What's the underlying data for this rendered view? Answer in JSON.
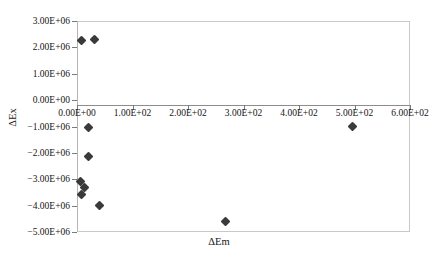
{
  "chart_data": {
    "type": "scatter",
    "title": "",
    "xlabel": "ΔEm",
    "ylabel": "ΔEx",
    "xlim": [
      0,
      600
    ],
    "ylim": [
      -5000000,
      3000000
    ],
    "grid": false,
    "legend": "none",
    "marker": "diamond",
    "marker_color": "#3a3a3a",
    "xticks": [
      0,
      100,
      200,
      300,
      400,
      500,
      600
    ],
    "xticklabels": [
      "0.00E+00",
      "1.00E+02",
      "2.00E+02",
      "3.00E+02",
      "4.00E+02",
      "5.00E+02",
      "6.00E+02"
    ],
    "yticks": [
      3000000,
      2000000,
      1000000,
      0,
      -1000000,
      -2000000,
      -3000000,
      -4000000,
      -5000000
    ],
    "yticklabels": [
      "3.00E+06",
      "2.00E+06",
      "1.00E+06",
      "0.00E+00",
      "−1.00E+06",
      "−2.00E+06",
      "−3.00E+06",
      "−4.00E+06",
      "−5.00E+06"
    ],
    "points": [
      {
        "x": 9,
        "y": 2270000
      },
      {
        "x": 32,
        "y": 2280000
      },
      {
        "x": 20,
        "y": -1020000
      },
      {
        "x": 20,
        "y": -2140000
      },
      {
        "x": 6,
        "y": -3100000
      },
      {
        "x": 14,
        "y": -3320000
      },
      {
        "x": 8,
        "y": -3590000
      },
      {
        "x": 41,
        "y": -3990000
      },
      {
        "x": 267,
        "y": -4620000
      },
      {
        "x": 497,
        "y": -1000000
      }
    ]
  }
}
